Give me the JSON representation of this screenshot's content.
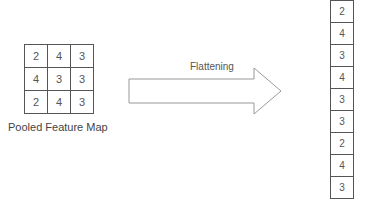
{
  "pooled_map": {
    "caption": "Pooled Feature Map",
    "rows": [
      [
        "2",
        "4",
        "3"
      ],
      [
        "4",
        "3",
        "3"
      ],
      [
        "2",
        "4",
        "3"
      ]
    ]
  },
  "arrow": {
    "label": "Flattening"
  },
  "flattened": {
    "values": [
      "2",
      "4",
      "3",
      "4",
      "3",
      "3",
      "2",
      "4",
      "3"
    ]
  }
}
